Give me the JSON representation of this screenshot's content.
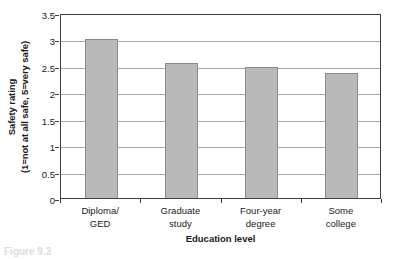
{
  "chart_data": {
    "type": "bar",
    "title": "",
    "subtitle": "",
    "xlabel": "Education level",
    "ylabel": "Safety rating",
    "ylabel_line2": "(1=not at all safe, 5=very safe)",
    "categories": [
      "Diploma/ GED",
      "Graduate study",
      "Four-year degree",
      "Some college"
    ],
    "category_lines": [
      [
        "Diploma/",
        "GED"
      ],
      [
        "Graduate",
        "study"
      ],
      [
        "Four-year",
        "degree"
      ],
      [
        "Some",
        "college"
      ]
    ],
    "values": [
      3.01,
      2.56,
      2.48,
      2.36
    ],
    "ylim": [
      0,
      3.5
    ],
    "ytick_labels": [
      "0",
      "0.5",
      "1",
      "1.5",
      "2",
      "2.5",
      "3",
      "3.5"
    ],
    "ytick_values": [
      0,
      0.5,
      1,
      1.5,
      2,
      2.5,
      3,
      3.5
    ],
    "grid": true,
    "legend": "none",
    "bar_fill_color": "#b9b9b9",
    "bar_border_color": "#8a8a8a",
    "gridline_color": "#a9a9a9",
    "axis_color": "#3f3f3f",
    "background_color": "#ffffff"
  },
  "caption": {
    "text": "Figure 9.3"
  }
}
